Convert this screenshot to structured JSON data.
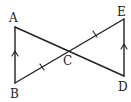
{
  "diagram": {
    "type": "geometry",
    "points": {
      "A": {
        "label": "A",
        "x": 15,
        "y": 27
      },
      "B": {
        "label": "B",
        "x": 15,
        "y": 83
      },
      "C": {
        "label": "C",
        "x": 68,
        "y": 51
      },
      "D": {
        "label": "D",
        "x": 124,
        "y": 76
      },
      "E": {
        "label": "E",
        "x": 124,
        "y": 19
      }
    },
    "segments": [
      {
        "from": "A",
        "to": "B",
        "marking": "parallel-arrow"
      },
      {
        "from": "A",
        "to": "D",
        "marking": "none"
      },
      {
        "from": "B",
        "to": "E",
        "marking": "none"
      },
      {
        "from": "D",
        "to": "E",
        "marking": "parallel-arrow"
      },
      {
        "from": "B",
        "to": "C",
        "marking": "single-tick"
      },
      {
        "from": "C",
        "to": "E",
        "marking": "single-tick"
      }
    ],
    "relations": [
      "AB ∥ DE",
      "BC = CE"
    ],
    "labels": {
      "A": "A",
      "B": "B",
      "C": "C",
      "D": "D",
      "E": "E"
    },
    "colors": {
      "line": "#222222",
      "background": "#ffffff"
    }
  }
}
